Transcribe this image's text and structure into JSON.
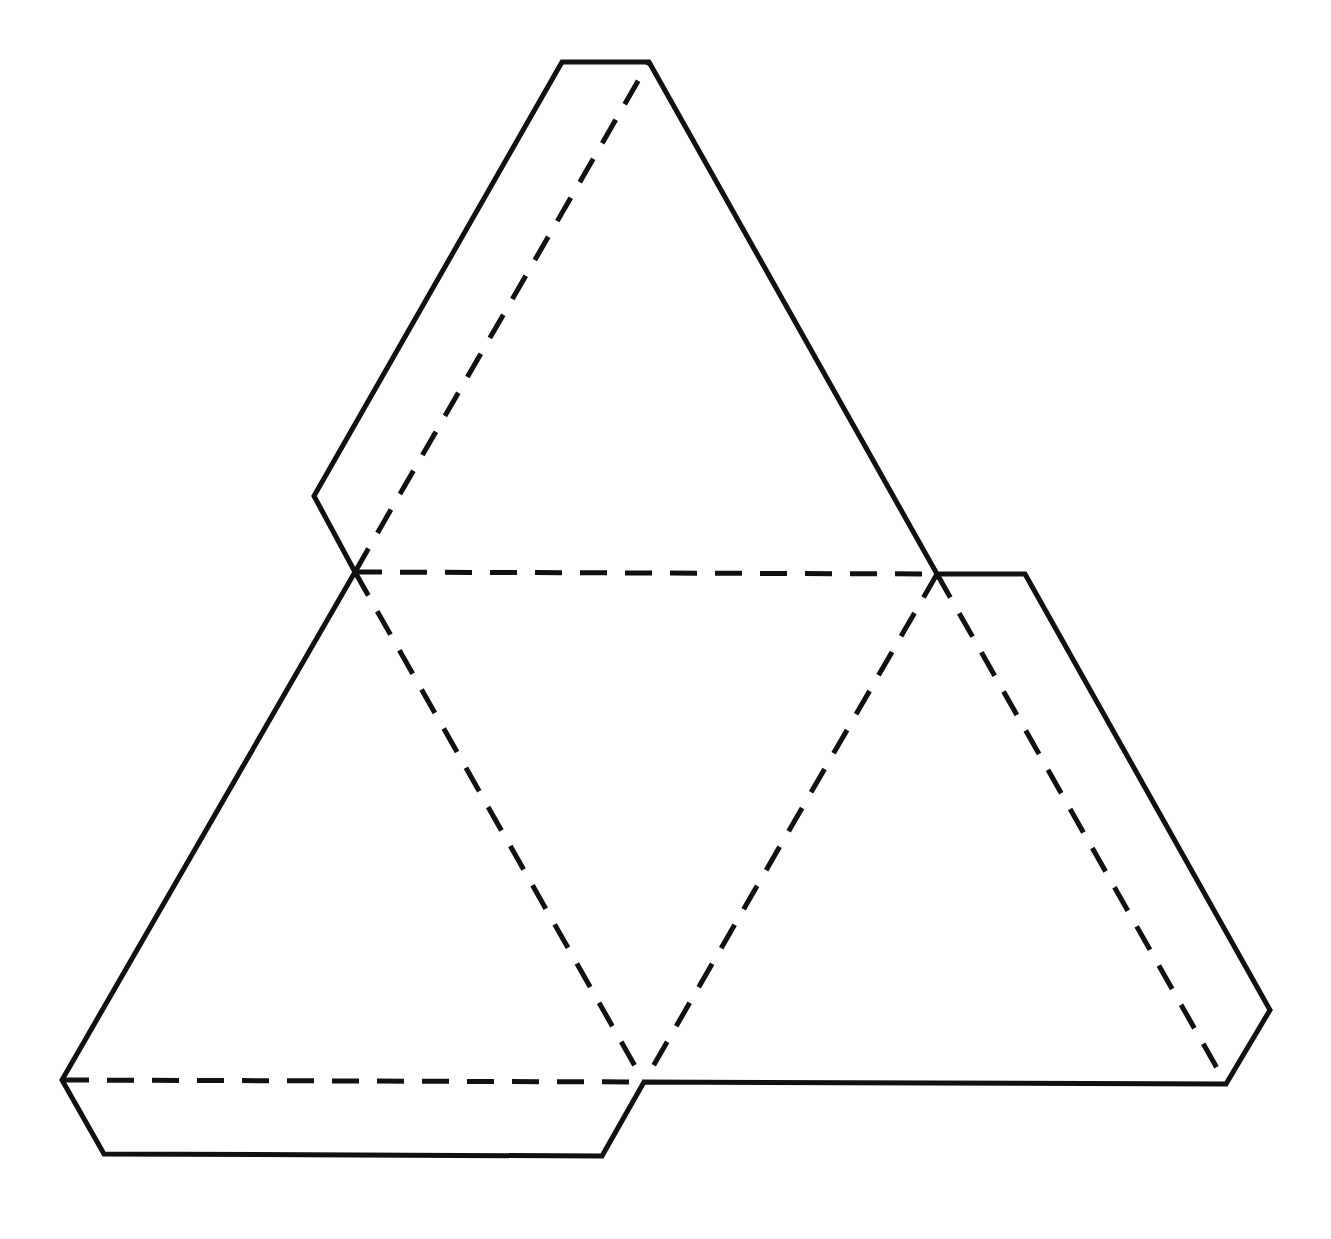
{
  "diagram": {
    "type": "net",
    "colors": {
      "background": "#ffffff",
      "line": "#111111"
    },
    "vertices": {
      "A": [
        355,
        572
      ],
      "B": [
        937,
        574
      ],
      "C": [
        62,
        1080
      ],
      "D": [
        644,
        1082
      ],
      "E": [
        1226,
        1084
      ],
      "F": [
        649,
        62
      ]
    },
    "faces": [
      {
        "name": "center-triangle",
        "points": [
          "A",
          "B",
          "D"
        ]
      },
      {
        "name": "top-triangle",
        "points": [
          "A",
          "F",
          "B"
        ]
      },
      {
        "name": "left-triangle",
        "points": [
          "A",
          "D",
          "C"
        ]
      },
      {
        "name": "right-triangle",
        "points": [
          "B",
          "E",
          "D"
        ]
      }
    ],
    "solid_outline": "562,62 649,62 937,574 1025,574 1270,1010 1226,1084 644,1082 602,1156 104,1154 62,1080 355,572 314,496",
    "dashed_folds": [
      [
        355,
        572,
        649,
        62
      ],
      [
        355,
        572,
        937,
        574
      ],
      [
        355,
        572,
        644,
        1082
      ],
      [
        937,
        574,
        644,
        1082
      ],
      [
        937,
        574,
        1226,
        1084
      ],
      [
        62,
        1080,
        644,
        1082
      ]
    ],
    "tabs": [
      {
        "name": "top-left-tab",
        "points": "355,572 314,496 562,62 649,62"
      },
      {
        "name": "right-tab",
        "points": "937,574 1025,574 1270,1010 1226,1084"
      },
      {
        "name": "bottom-tab",
        "points": "62,1080 104,1154 602,1156 644,1082"
      }
    ]
  }
}
